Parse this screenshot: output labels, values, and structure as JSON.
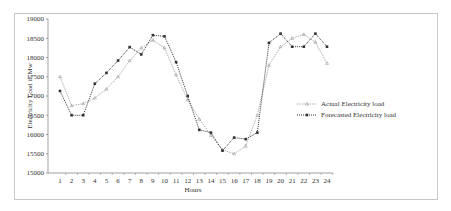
{
  "chart_data": {
    "type": "line",
    "title": "",
    "xlabel": "Hours",
    "ylabel": "Electricity Load in Mw",
    "ylim": [
      15000,
      19000
    ],
    "yticks": [
      15000,
      15500,
      16000,
      16500,
      17000,
      17500,
      18000,
      18500,
      19000
    ],
    "x": [
      1,
      2,
      3,
      4,
      5,
      6,
      7,
      8,
      9,
      10,
      11,
      12,
      13,
      14,
      15,
      16,
      17,
      18,
      19,
      20,
      21,
      22,
      23,
      24
    ],
    "grid": false,
    "legend_position": "right",
    "series": [
      {
        "name": "Actual Electricity load",
        "color": "#9a9a9a",
        "marker": "triangle",
        "values": [
          17500,
          16750,
          16800,
          16950,
          17180,
          17500,
          17920,
          18250,
          18450,
          18250,
          17550,
          16900,
          16400,
          15980,
          15600,
          15500,
          15700,
          16500,
          17800,
          18280,
          18500,
          18600,
          18400,
          17850
        ]
      },
      {
        "name": "Forecasted Electricity load",
        "color": "#333333",
        "marker": "square",
        "values": [
          17130,
          16500,
          16500,
          17320,
          17600,
          17920,
          18270,
          18080,
          18580,
          18550,
          17880,
          17000,
          16120,
          16050,
          15580,
          15920,
          15880,
          16050,
          18380,
          18620,
          18280,
          18280,
          18620,
          18280
        ]
      }
    ]
  }
}
